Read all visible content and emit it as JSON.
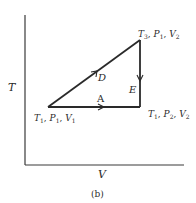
{
  "figure": {
    "caption": "(b)",
    "axes": {
      "x_label": "V",
      "y_label": "T"
    },
    "vertices": {
      "start": {
        "T": "T",
        "T_sub": "1",
        "P": "P",
        "P_sub": "1",
        "V": "V",
        "V_sub": "1"
      },
      "top": {
        "T": "T",
        "T_sub": "3",
        "P": "P",
        "P_sub": "1",
        "V": "V",
        "V_sub": "2"
      },
      "end": {
        "T": "T",
        "T_sub": "1",
        "P": "P",
        "P_sub": "2",
        "V": "V",
        "V_sub": "2"
      }
    },
    "paths": {
      "A": "A",
      "D": "D",
      "E": "E"
    },
    "colors": {
      "line": "#2a2a2a",
      "axis": "#3a3a3a",
      "background": "#ffffff"
    }
  }
}
